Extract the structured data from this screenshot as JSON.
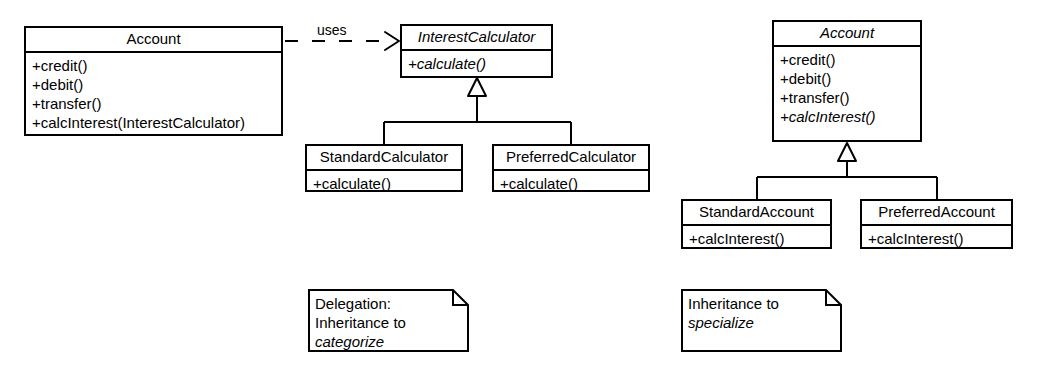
{
  "diagram": {
    "stroke_color": "#000000",
    "fill_color": "#ffffff",
    "background": "#ffffff"
  },
  "left_model": {
    "account": {
      "name": "Account",
      "name_abstract": false,
      "operations": [
        {
          "text": "+credit()",
          "abstract": false
        },
        {
          "text": "+debit()",
          "abstract": false
        },
        {
          "text": "+transfer()",
          "abstract": false
        },
        {
          "text": "+calcInterest(InterestCalculator)",
          "abstract": false
        }
      ]
    },
    "dependency": {
      "label": "uses",
      "kind": "dependency",
      "line_style": "dashed",
      "arrowhead": "open",
      "from": "Account",
      "to": "InterestCalculator"
    },
    "interest_calculator": {
      "name": "InterestCalculator",
      "name_abstract": true,
      "operations": [
        {
          "text": "+calculate()",
          "abstract": true
        }
      ]
    },
    "standard_calculator": {
      "name": "StandardCalculator",
      "name_abstract": false,
      "operations": [
        {
          "text": "+calculate()",
          "abstract": false
        }
      ]
    },
    "preferred_calculator": {
      "name": "PreferredCalculator",
      "name_abstract": false,
      "operations": [
        {
          "text": "+calculate()",
          "abstract": false
        }
      ]
    },
    "note": {
      "lines": [
        {
          "text": "Delegation:",
          "italic": false
        },
        {
          "text": "Inheritance to",
          "italic": false
        },
        {
          "text": "categorize",
          "italic": true
        }
      ]
    }
  },
  "right_model": {
    "account": {
      "name": "Account",
      "name_abstract": true,
      "operations": [
        {
          "text": "+credit()",
          "abstract": false
        },
        {
          "text": "+debit()",
          "abstract": false
        },
        {
          "text": "+transfer()",
          "abstract": false
        },
        {
          "text": "+calcInterest()",
          "abstract": true
        }
      ]
    },
    "standard_account": {
      "name": "StandardAccount",
      "name_abstract": false,
      "operations": [
        {
          "text": "+calcInterest()",
          "abstract": false
        }
      ]
    },
    "preferred_account": {
      "name": "PreferredAccount",
      "name_abstract": false,
      "operations": [
        {
          "text": "+calcInterest()",
          "abstract": false
        }
      ]
    },
    "note": {
      "lines": [
        {
          "text": "Inheritance to",
          "italic": false
        },
        {
          "text": "specialize",
          "italic": true
        }
      ]
    }
  }
}
